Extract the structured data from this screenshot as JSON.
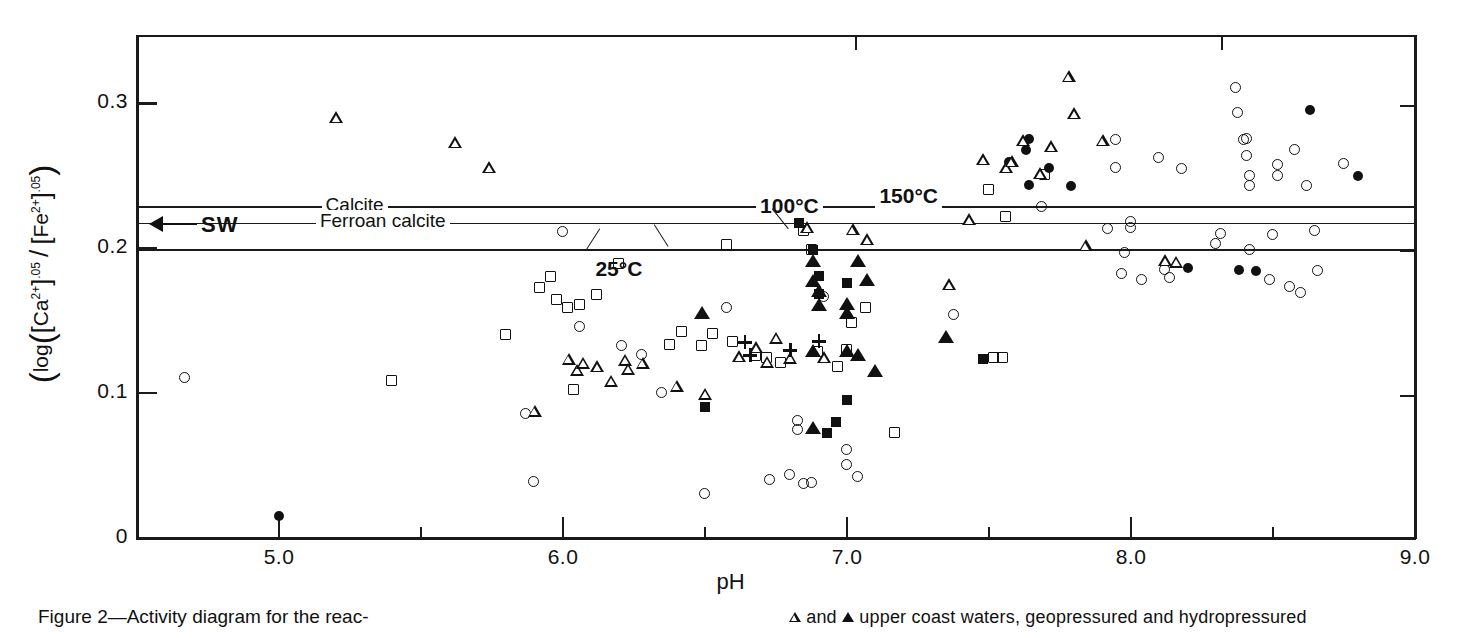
{
  "figure": {
    "caption_left": "Figure 2—Activity diagram for the reac-",
    "legend_line": "and ▲ upper coast waters, geopressured and hydropressured",
    "legend_open_symbol": "open-triangle",
    "legend_filled_symbol": "filled-triangle"
  },
  "chart_data": {
    "type": "scatter",
    "title": "",
    "xlabel": "pH",
    "ylabel": "log([Ca2+].05 / [Fe2+].05)",
    "ylabel_parts": {
      "prefix": "log",
      "num_species": "Ca",
      "num_charge": "2+",
      "num_exp": ".05",
      "den_species": "Fe",
      "den_charge": "2+",
      "den_exp": ".05"
    },
    "xlim": [
      4.5,
      9.0
    ],
    "ylim": [
      0.0,
      0.3472
    ],
    "grid": false,
    "legend_position": "below-right",
    "x_ticks_major": [
      5.0,
      6.0,
      7.0,
      8.0,
      9.0
    ],
    "x_tick_labels": [
      "5.0",
      "6.0",
      "7.0",
      "8.0",
      "9.0"
    ],
    "x_ticks_minor": [
      5.5,
      6.5,
      7.5,
      8.5
    ],
    "y_ticks_major": [
      0,
      0.1,
      0.2,
      0.3
    ],
    "y_tick_labels": [
      "0",
      "0.1",
      "0.2",
      "0.3"
    ],
    "reference_lines": [
      {
        "name": "calcite-150C",
        "y": 0.2283,
        "labels": [
          "Calcite",
          "150°C"
        ]
      },
      {
        "name": "ferroan-calcite-100C",
        "y": 0.2172,
        "labels": [
          "Ferroan calcite",
          "100°C"
        ]
      },
      {
        "name": "ferroan-calcite-25C",
        "y": 0.1986,
        "labels": [
          "25°C"
        ]
      }
    ],
    "annotations": [
      {
        "name": "sw-marker",
        "text": "SW",
        "y": 0.2228,
        "arrow": "left"
      },
      {
        "name": "calcite-label",
        "text": "Calcite",
        "x": 5.15,
        "y": 0.2283
      },
      {
        "name": "ferroan-calcite-label",
        "text": "Ferroan calcite",
        "x": 5.13,
        "y": 0.2172
      },
      {
        "name": "temp-100-label",
        "text": "100°C",
        "x": 6.68,
        "y": 0.2283
      },
      {
        "name": "temp-150-label",
        "text": "150°C",
        "x": 7.1,
        "y": 0.2352
      },
      {
        "name": "temp-25-label",
        "text": "25°C",
        "x": 6.1,
        "y": 0.1848
      }
    ],
    "series": [
      {
        "name": "open-circle",
        "marker": "oc",
        "points": [
          [
            4.67,
            0.1103
          ],
          [
            5.87,
            0.0855
          ],
          [
            5.9,
            0.0386
          ],
          [
            6.0,
            0.211
          ],
          [
            6.06,
            0.1455
          ],
          [
            6.21,
            0.1324
          ],
          [
            6.28,
            0.1262
          ],
          [
            6.35,
            0.1
          ],
          [
            6.5,
            0.0297
          ],
          [
            6.58,
            0.1586
          ],
          [
            6.73,
            0.04
          ],
          [
            6.8,
            0.0428
          ],
          [
            6.83,
            0.0807
          ],
          [
            6.83,
            0.0745
          ],
          [
            6.85,
            0.0372
          ],
          [
            6.88,
            0.0379
          ],
          [
            6.92,
            0.1662
          ],
          [
            7.0,
            0.0503
          ],
          [
            7.0,
            0.0607
          ],
          [
            7.04,
            0.0421
          ],
          [
            7.38,
            0.1538
          ],
          [
            7.69,
            0.2283
          ],
          [
            7.92,
            0.2131
          ],
          [
            7.95,
            0.2745
          ],
          [
            7.95,
            0.2552
          ],
          [
            7.97,
            0.1821
          ],
          [
            7.98,
            0.1965
          ],
          [
            8.0,
            0.2179
          ],
          [
            8.0,
            0.2138
          ],
          [
            8.04,
            0.1779
          ],
          [
            8.1,
            0.2621
          ],
          [
            8.12,
            0.1848
          ],
          [
            8.14,
            0.1793
          ],
          [
            8.18,
            0.2545
          ],
          [
            8.3,
            0.2028
          ],
          [
            8.32,
            0.2097
          ],
          [
            8.37,
            0.3103
          ],
          [
            8.38,
            0.2931
          ],
          [
            8.4,
            0.2745
          ],
          [
            8.41,
            0.2752
          ],
          [
            8.41,
            0.2634
          ],
          [
            8.42,
            0.2497
          ],
          [
            8.42,
            0.2428
          ],
          [
            8.42,
            0.1986
          ],
          [
            8.49,
            0.1779
          ],
          [
            8.5,
            0.209
          ],
          [
            8.52,
            0.2572
          ],
          [
            8.52,
            0.2496
          ],
          [
            8.56,
            0.1731
          ],
          [
            8.58,
            0.2676
          ],
          [
            8.6,
            0.169
          ],
          [
            8.62,
            0.2428
          ],
          [
            8.65,
            0.2117
          ],
          [
            8.66,
            0.1841
          ],
          [
            8.75,
            0.2579
          ]
        ]
      },
      {
        "name": "filled-circle",
        "marker": "fc",
        "points": [
          [
            5.0,
            0.0152
          ],
          [
            7.57,
            0.2593
          ],
          [
            7.63,
            0.2676
          ],
          [
            7.64,
            0.2752
          ],
          [
            7.64,
            0.2434
          ],
          [
            7.71,
            0.2552
          ],
          [
            7.79,
            0.2428
          ],
          [
            8.2,
            0.1862
          ],
          [
            8.38,
            0.1848
          ],
          [
            8.44,
            0.1841
          ],
          [
            8.63,
            0.2952
          ],
          [
            8.8,
            0.2497
          ]
        ]
      },
      {
        "name": "open-square",
        "marker": "os",
        "points": [
          [
            5.4,
            0.1083
          ],
          [
            5.8,
            0.14
          ],
          [
            5.92,
            0.1724
          ],
          [
            5.96,
            0.18
          ],
          [
            5.98,
            0.1641
          ],
          [
            6.02,
            0.1586
          ],
          [
            6.04,
            0.1021
          ],
          [
            6.06,
            0.1607
          ],
          [
            6.12,
            0.1676
          ],
          [
            6.2,
            0.1889
          ],
          [
            6.38,
            0.1331
          ],
          [
            6.42,
            0.1421
          ],
          [
            6.49,
            0.1324
          ],
          [
            6.53,
            0.1407
          ],
          [
            6.58,
            0.2021
          ],
          [
            6.6,
            0.1352
          ],
          [
            6.68,
            0.1255
          ],
          [
            6.72,
            0.1241
          ],
          [
            6.77,
            0.1207
          ],
          [
            6.85,
            0.2117
          ],
          [
            6.88,
            0.1986
          ],
          [
            6.9,
            0.1283
          ],
          [
            6.97,
            0.1179
          ],
          [
            7.0,
            0.1296
          ],
          [
            7.02,
            0.1483
          ],
          [
            7.07,
            0.1586
          ],
          [
            7.17,
            0.0724
          ],
          [
            7.5,
            0.24
          ],
          [
            7.52,
            0.1241
          ],
          [
            7.55,
            0.1241
          ],
          [
            7.56,
            0.2214
          ],
          [
            7.7,
            0.2503
          ]
        ]
      },
      {
        "name": "filled-square",
        "marker": "fs",
        "points": [
          [
            6.5,
            0.0903
          ],
          [
            6.83,
            0.2172
          ],
          [
            6.88,
            0.1986
          ],
          [
            6.9,
            0.1807
          ],
          [
            6.9,
            0.1683
          ],
          [
            6.93,
            0.0724
          ],
          [
            6.96,
            0.08
          ],
          [
            7.0,
            0.1759
          ],
          [
            7.0,
            0.0952
          ],
          [
            7.48,
            0.1234
          ]
        ]
      },
      {
        "name": "open-triangle",
        "marker": "ot",
        "points": [
          [
            5.2,
            0.289
          ],
          [
            5.62,
            0.2717
          ],
          [
            5.74,
            0.2545
          ],
          [
            5.9,
            0.0862
          ],
          [
            6.02,
            0.1221
          ],
          [
            6.05,
            0.1145
          ],
          [
            6.07,
            0.1193
          ],
          [
            6.12,
            0.1172
          ],
          [
            6.17,
            0.1069
          ],
          [
            6.22,
            0.1214
          ],
          [
            6.23,
            0.1152
          ],
          [
            6.28,
            0.1193
          ],
          [
            6.4,
            0.1034
          ],
          [
            6.5,
            0.0979
          ],
          [
            6.62,
            0.1241
          ],
          [
            6.68,
            0.1303
          ],
          [
            6.72,
            0.12
          ],
          [
            6.75,
            0.1366
          ],
          [
            6.8,
            0.1228
          ],
          [
            6.86,
            0.2131
          ],
          [
            6.92,
            0.1234
          ],
          [
            7.02,
            0.2117
          ],
          [
            7.07,
            0.2048
          ],
          [
            7.36,
            0.1738
          ],
          [
            7.43,
            0.2186
          ],
          [
            7.48,
            0.26
          ],
          [
            7.56,
            0.2545
          ],
          [
            7.58,
            0.2586
          ],
          [
            7.62,
            0.2731
          ],
          [
            7.68,
            0.2503
          ],
          [
            7.72,
            0.269
          ],
          [
            7.78,
            0.3172
          ],
          [
            7.8,
            0.2917
          ],
          [
            7.84,
            0.2007
          ],
          [
            7.9,
            0.2731
          ],
          [
            8.12,
            0.1903
          ],
          [
            8.16,
            0.189
          ]
        ]
      },
      {
        "name": "filled-triangle",
        "marker": "ft",
        "points": [
          [
            6.49,
            0.1545
          ],
          [
            6.88,
            0.1903
          ],
          [
            6.88,
            0.1766
          ],
          [
            6.88,
            0.1283
          ],
          [
            6.9,
            0.1697
          ],
          [
            6.9,
            0.16
          ],
          [
            7.0,
            0.1607
          ],
          [
            7.0,
            0.1545
          ],
          [
            7.0,
            0.1283
          ],
          [
            7.04,
            0.1903
          ],
          [
            7.04,
            0.1255
          ],
          [
            7.07,
            0.1772
          ],
          [
            7.1,
            0.1145
          ],
          [
            7.35,
            0.1379
          ],
          [
            6.88,
            0.0752
          ]
        ]
      },
      {
        "name": "plus",
        "marker": "pl",
        "points": [
          [
            6.64,
            0.1352
          ],
          [
            6.66,
            0.1262
          ],
          [
            6.8,
            0.1296
          ],
          [
            6.9,
            0.1359
          ]
        ]
      }
    ]
  }
}
